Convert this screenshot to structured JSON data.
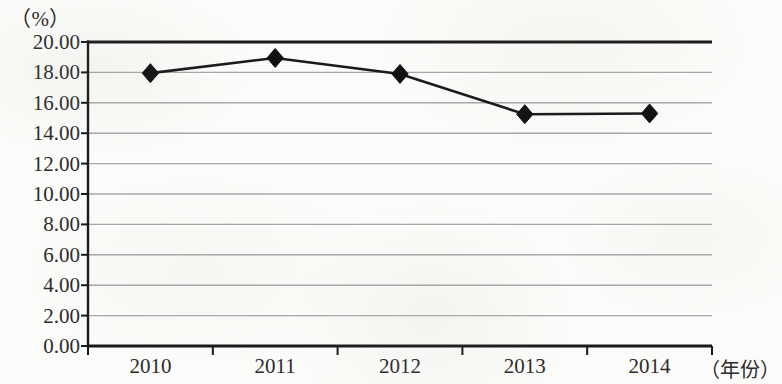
{
  "chart_data": {
    "type": "line",
    "title": "",
    "subtitle": "",
    "xlabel": "（年份）",
    "ylabel": "（%）",
    "categories": [
      "2010",
      "2011",
      "2012",
      "2013",
      "2014"
    ],
    "values": [
      17.95,
      18.95,
      17.9,
      15.25,
      15.3
    ],
    "series": [
      {
        "name": "",
        "values": [
          17.95,
          18.95,
          17.9,
          15.25,
          15.3
        ]
      }
    ],
    "ylim": [
      0.0,
      20.0
    ],
    "ytick_step": 2.0,
    "ytick_labels": [
      "20.00",
      "18.00",
      "16.00",
      "14.00",
      "12.00",
      "10.00",
      "8.00",
      "6.00",
      "4.00",
      "2.00",
      "0.00"
    ],
    "ytick_values": [
      20.0,
      18.0,
      16.0,
      14.0,
      12.0,
      10.0,
      8.0,
      6.0,
      4.0,
      2.0,
      0.0
    ],
    "grid": true,
    "legend": "none",
    "marker": "diamond",
    "line_color": "#1a1a1a",
    "marker_color": "#111111",
    "grid_color": "#a8a8a8",
    "axis_color": "#1a1a1a",
    "background_color": "#fbfbf9",
    "annotations": []
  }
}
